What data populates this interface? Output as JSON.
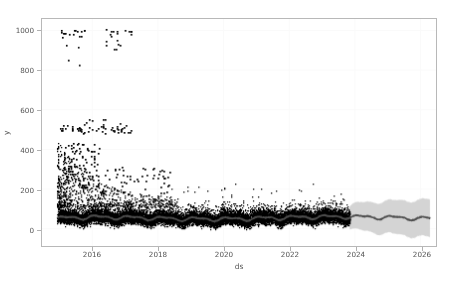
{
  "figure": {
    "background_color": "#ffffff",
    "frame_color": "#b8b8b8",
    "width": 457,
    "height": 282
  },
  "chart_data": {
    "type": "line",
    "title": "",
    "xlabel": "ds",
    "ylabel": "y",
    "grid": true,
    "grid_color": "#fafafa",
    "legend": "none",
    "xlim": [
      "2014-06",
      "2026-06"
    ],
    "ylim": [
      -120,
      1060
    ],
    "ytick_labels": [
      "0",
      "200",
      "400",
      "600",
      "800",
      "1000"
    ],
    "ytick_values": [
      0,
      200,
      400,
      600,
      800,
      1000
    ],
    "xtick_labels": [
      "2016",
      "2018",
      "2020",
      "2022",
      "2024",
      "2026"
    ],
    "xtick_values": [
      2016,
      2018,
      2020,
      2022,
      2024,
      2026
    ],
    "history_start": 2014.95,
    "history_end": 2023.85,
    "forecast_end": 2026.3,
    "series": [
      {
        "name": "observed",
        "role": "scatter-points",
        "color": "#000000",
        "marker": ".",
        "marker_size": 1.6,
        "description": "Black observation dots, dense band near 0-110 across history with sparse high outliers",
        "band_low": -10,
        "band_high": 105,
        "outlier_clusters": [
          {
            "x_start": 2015.0,
            "x_end": 2015.2,
            "y_low": 950,
            "y_high": 1000,
            "count": 6
          },
          {
            "x_start": 2015.3,
            "x_end": 2015.8,
            "y_low": 960,
            "y_high": 1005,
            "count": 10
          },
          {
            "x_start": 2016.4,
            "x_end": 2016.9,
            "y_low": 900,
            "y_high": 1005,
            "count": 14
          },
          {
            "x_start": 2017.0,
            "x_end": 2017.2,
            "y_low": 975,
            "y_high": 1000,
            "count": 5
          },
          {
            "x_start": 2015.1,
            "x_end": 2015.6,
            "y_low": 820,
            "y_high": 930,
            "count": 4
          },
          {
            "x_start": 2015.0,
            "x_end": 2017.2,
            "y_low": 470,
            "y_high": 560,
            "count": 60
          },
          {
            "x_start": 2015.1,
            "x_end": 2016.2,
            "y_low": 200,
            "y_high": 430,
            "count": 110
          },
          {
            "x_start": 2016.2,
            "x_end": 2018.4,
            "y_low": 120,
            "y_high": 310,
            "count": 70
          }
        ]
      },
      {
        "name": "yhat",
        "role": "forecast-line",
        "color": "#4d4d4d",
        "line_width": 1.3,
        "description": "Grey trend line oscillating roughly 35-70 through history and forecast",
        "mean_level": 52,
        "seasonal_amplitude": 14
      },
      {
        "name": "yhat_uncertainty",
        "role": "uncertainty-band",
        "color": "#cccccc",
        "opacity": 0.85,
        "description": "Light grey uncertainty interval, narrow in history (~±35) widening after 2024 (~±90)",
        "history_halfwidth": 34,
        "forecast_halfwidth_start": 55,
        "forecast_halfwidth_end": 95
      }
    ]
  }
}
